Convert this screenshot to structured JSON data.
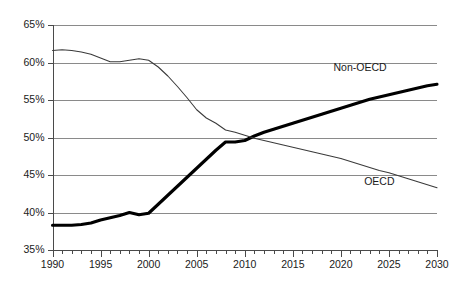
{
  "chart_data": {
    "type": "line",
    "title": "",
    "subtitle": "",
    "xlabel": "",
    "ylabel": "",
    "xlim": [
      1990,
      2030
    ],
    "ylim": [
      35,
      65
    ],
    "y_tick_step": 5,
    "x_tick_step": 5,
    "x_minor_tick_step": 1,
    "grid": "horizontal",
    "legend_position": "inline-annotation",
    "y_tick_labels": [
      "35%",
      "40%",
      "45%",
      "50%",
      "55%",
      "60%",
      "65%"
    ],
    "y_tick_values": [
      35,
      40,
      45,
      50,
      55,
      60,
      65
    ],
    "x_tick_labels": [
      "1990",
      "1995",
      "2000",
      "2005",
      "2010",
      "2015",
      "2020",
      "2025",
      "2030"
    ],
    "x_tick_values": [
      1990,
      1995,
      2000,
      2005,
      2010,
      2015,
      2020,
      2025,
      2030
    ],
    "x": [
      1990,
      1991,
      1992,
      1993,
      1994,
      1995,
      1996,
      1997,
      1998,
      1999,
      2000,
      2001,
      2002,
      2003,
      2004,
      2005,
      2006,
      2007,
      2008,
      2009,
      2010,
      2011,
      2012,
      2013,
      2014,
      2015,
      2016,
      2017,
      2018,
      2019,
      2020,
      2021,
      2022,
      2023,
      2024,
      2025,
      2026,
      2027,
      2028,
      2029,
      2030
    ],
    "series": [
      {
        "name": "Non-OECD",
        "style": "thick",
        "color": "#000000",
        "label_x": 2022,
        "label_y": 59.2,
        "values": [
          38.3,
          38.3,
          38.3,
          38.4,
          38.6,
          39.0,
          39.3,
          39.6,
          40.0,
          39.7,
          39.9,
          41.1,
          42.3,
          43.5,
          44.7,
          45.9,
          47.1,
          48.3,
          49.4,
          49.4,
          49.6,
          50.2,
          50.7,
          51.1,
          51.5,
          51.9,
          52.3,
          52.7,
          53.1,
          53.5,
          53.9,
          54.3,
          54.7,
          55.1,
          55.4,
          55.7,
          56.0,
          56.3,
          56.6,
          56.9,
          57.1
        ]
      },
      {
        "name": "OECD",
        "style": "thin",
        "color": "#3a3a3a",
        "label_x": 2024,
        "label_y": 44.0,
        "values": [
          61.6,
          61.7,
          61.6,
          61.4,
          61.1,
          60.6,
          60.1,
          60.1,
          60.3,
          60.5,
          60.3,
          59.4,
          58.2,
          56.8,
          55.3,
          53.7,
          52.6,
          51.9,
          51.0,
          50.7,
          50.3,
          49.9,
          49.6,
          49.3,
          49.0,
          48.7,
          48.4,
          48.1,
          47.8,
          47.5,
          47.2,
          46.8,
          46.4,
          46.0,
          45.6,
          45.3,
          44.9,
          44.5,
          44.1,
          43.7,
          43.3
        ]
      }
    ]
  },
  "annotations": {
    "non_oecd_label": "Non-OECD",
    "oecd_label": "OECD"
  }
}
